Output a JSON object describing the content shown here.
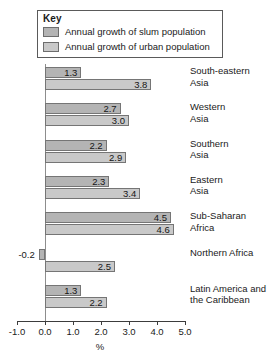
{
  "legend": {
    "title": "Key",
    "entries": [
      {
        "label": "Annual growth of slum population",
        "color": "#b4b4b4",
        "icon": "legend-swatch-icon"
      },
      {
        "label": "Annual growth of urban population",
        "color": "#c9c9c9",
        "icon": "legend-swatch-icon"
      }
    ]
  },
  "axis": {
    "tick_labels": [
      "-1.0",
      "0.0",
      "1.0",
      "2.0",
      "3.0",
      "4.0",
      "5.0"
    ],
    "title": "%"
  },
  "chart_data": {
    "type": "bar",
    "orientation": "horizontal",
    "title": "",
    "xlabel": "%",
    "ylabel": "",
    "xlim": [
      -1.0,
      5.0
    ],
    "xticks": [
      -1.0,
      0.0,
      1.0,
      2.0,
      3.0,
      4.0,
      5.0
    ],
    "grid": false,
    "legend_position": "top-left",
    "categories": [
      "South-eastern Asia",
      "Western Asia",
      "Southern Asia",
      "Eastern Asia",
      "Sub-Saharan Africa",
      "Northern Africa",
      "Latin America and the Caribbean"
    ],
    "series": [
      {
        "name": "Annual growth of slum population",
        "color": "#b4b4b4",
        "values": [
          1.3,
          2.7,
          2.2,
          2.3,
          4.5,
          -0.2,
          1.3
        ]
      },
      {
        "name": "Annual growth of urban population",
        "color": "#c9c9c9",
        "values": [
          3.8,
          3.0,
          2.9,
          3.4,
          4.6,
          2.5,
          2.2
        ]
      }
    ]
  },
  "groups": [
    {
      "label_line1": "South-eastern",
      "label_line2": "Asia",
      "slum": {
        "value": "1.3",
        "num": 1.3
      },
      "urban": {
        "value": "3.8",
        "num": 3.8
      }
    },
    {
      "label_line1": "Western",
      "label_line2": "Asia",
      "slum": {
        "value": "2.7",
        "num": 2.7
      },
      "urban": {
        "value": "3.0",
        "num": 3.0
      }
    },
    {
      "label_line1": "Southern",
      "label_line2": "Asia",
      "slum": {
        "value": "2.2",
        "num": 2.2
      },
      "urban": {
        "value": "2.9",
        "num": 2.9
      }
    },
    {
      "label_line1": "Eastern",
      "label_line2": "Asia",
      "slum": {
        "value": "2.3",
        "num": 2.3
      },
      "urban": {
        "value": "3.4",
        "num": 3.4
      }
    },
    {
      "label_line1": "Sub-Saharan",
      "label_line2": "Africa",
      "slum": {
        "value": "4.5",
        "num": 4.5
      },
      "urban": {
        "value": "4.6",
        "num": 4.6
      }
    },
    {
      "label_line1": "Northern Africa",
      "label_line2": "",
      "slum": {
        "value": "-0.2",
        "num": -0.2
      },
      "urban": {
        "value": "2.5",
        "num": 2.5
      }
    },
    {
      "label_line1": "Latin America and",
      "label_line2": "the Caribbean",
      "slum": {
        "value": "1.3",
        "num": 1.3
      },
      "urban": {
        "value": "2.2",
        "num": 2.2
      }
    }
  ]
}
